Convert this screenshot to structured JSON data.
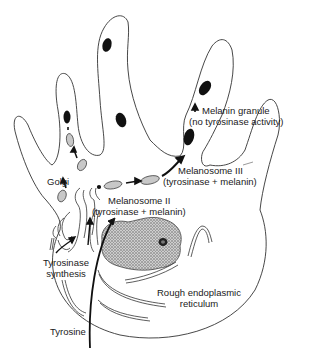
{
  "labels": {
    "melanin_granule_1": "Melanin granule",
    "melanin_granule_2": "(no tyrosinase activity)",
    "melanosome_iii_1": "Melanosome III",
    "melanosome_iii_2": "(tyrosinase + melanin)",
    "golgi": "Golgi",
    "melanosome_ii_1": "Melanosome II",
    "melanosome_ii_2": "(tyrosinase + melanin)",
    "tyrosinase_synthesis_1": "Tyrosinase",
    "tyrosinase_synthesis_2": "synthesis",
    "rough_er_1": "Rough endoplasmic",
    "rough_er_2": "reticulum",
    "tyrosine": "Tyrosine"
  },
  "colors": {
    "outline": "#333333",
    "melanin": "#111111",
    "melanosome_fill": "#c8c8c8",
    "nucleus_fill": "#b5b5b5"
  }
}
